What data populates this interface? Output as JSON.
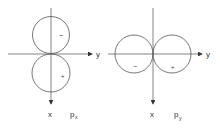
{
  "diagrams": [
    {
      "name": "p_x orbital",
      "label_main": "p",
      "label_sub": "x",
      "axis_horizontal": "y",
      "axis_vertical": "x",
      "lobe_signs": [
        "−",
        "+"
      ]
    },
    {
      "name": "p_y orbital",
      "label_main": "p",
      "label_sub": "y",
      "axis_horizontal": "y",
      "axis_vertical": "x",
      "lobe_signs": [
        "−",
        "+"
      ]
    }
  ],
  "colors": {
    "line": "#555555",
    "background": "#ffffff"
  }
}
